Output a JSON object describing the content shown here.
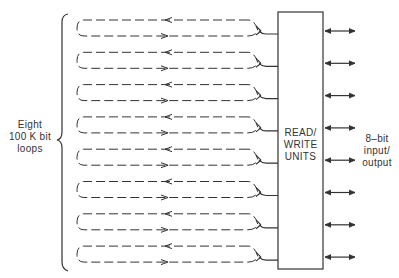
{
  "diagram": {
    "title_left": [
      "Eight",
      "100 K bit",
      "loops"
    ],
    "box_label": [
      "READ/",
      "WRITE",
      "UNITS"
    ],
    "io_label": [
      "8–bit",
      "input/",
      "output"
    ],
    "loop_count": 8,
    "loops": [
      {
        "id": 1,
        "direction_top": "left",
        "direction_bottom": "right"
      },
      {
        "id": 2,
        "direction_top": "left",
        "direction_bottom": "right"
      },
      {
        "id": 3,
        "direction_top": "left",
        "direction_bottom": "right"
      },
      {
        "id": 4,
        "direction_top": "left",
        "direction_bottom": "right"
      },
      {
        "id": 5,
        "direction_top": "left",
        "direction_bottom": "right"
      },
      {
        "id": 6,
        "direction_top": "left",
        "direction_bottom": "right"
      },
      {
        "id": 7,
        "direction_top": "left",
        "direction_bottom": "right"
      },
      {
        "id": 8,
        "direction_top": "left",
        "direction_bottom": "right"
      }
    ],
    "io_arrows": 8,
    "colors": {
      "line": "#333333",
      "dash": "#444444",
      "background": "#ffffff"
    }
  }
}
